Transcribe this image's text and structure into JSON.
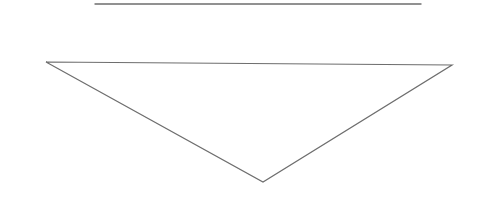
{
  "diagram": {
    "width": 485,
    "height": 198,
    "stroke_color": "#6e6e6e",
    "top_line": {
      "x1": 95,
      "y1": 4,
      "x2": 421,
      "y2": 4
    },
    "triangle": {
      "points": [
        [
          46,
          62
        ],
        [
          452,
          65
        ],
        [
          263,
          182
        ]
      ]
    }
  }
}
